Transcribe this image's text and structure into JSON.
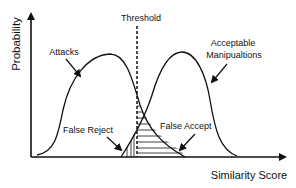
{
  "diagram": {
    "type": "overlapping-distributions",
    "y_axis_label": "Probability",
    "x_axis_label": "Similarity Score",
    "threshold_label": "Threshold",
    "distributions": [
      {
        "name": "attacks",
        "label": "Attacks"
      },
      {
        "name": "acceptable-manipulations",
        "label_line1": "Acceptable",
        "label_line2": "Manipualtions"
      }
    ],
    "regions": [
      {
        "name": "false-reject",
        "label": "False Reject"
      },
      {
        "name": "false-accept",
        "label": "False Accept"
      }
    ],
    "colors": {
      "ink": "#111111",
      "background": "#ffffff"
    }
  }
}
